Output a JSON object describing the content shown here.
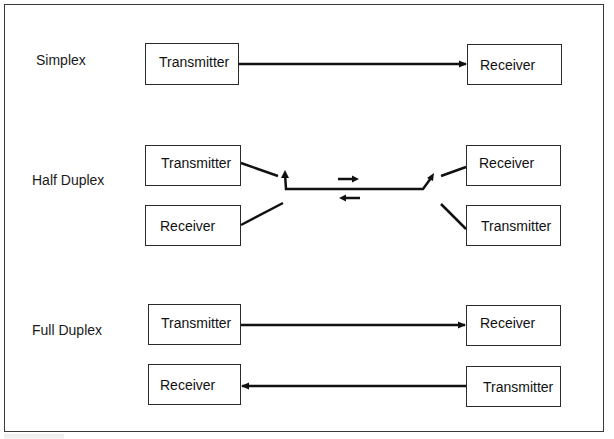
{
  "diagram": {
    "type": "transmission-modes",
    "modes": [
      {
        "name": "Simplex",
        "left": [
          {
            "label": "Transmitter"
          }
        ],
        "right": [
          {
            "label": "Receiver"
          }
        ],
        "links": [
          {
            "from": "Transmitter",
            "to": "Receiver",
            "direction": "left-to-right"
          }
        ]
      },
      {
        "name": "Half Duplex",
        "left": [
          {
            "label": "Transmitter"
          },
          {
            "label": "Receiver"
          }
        ],
        "right": [
          {
            "label": "Receiver"
          },
          {
            "label": "Transmitter"
          }
        ],
        "links": [
          {
            "type": "shared-switched-line",
            "direction_indicators": [
              "right-arrow",
              "left-arrow"
            ]
          }
        ]
      },
      {
        "name": "Full Duplex",
        "left": [
          {
            "label": "Transmitter"
          },
          {
            "label": "Receiver"
          }
        ],
        "right": [
          {
            "label": "Receiver"
          },
          {
            "label": "Transmitter"
          }
        ],
        "links": [
          {
            "from": "Transmitter",
            "to": "Receiver",
            "direction": "left-to-right"
          },
          {
            "from": "Transmitter",
            "to": "Receiver",
            "direction": "right-to-left"
          }
        ]
      }
    ]
  },
  "colors": {
    "line": "#111111",
    "box_border": "#2a2a2a",
    "frame": "#3a3a3a",
    "background": "#ffffff"
  }
}
